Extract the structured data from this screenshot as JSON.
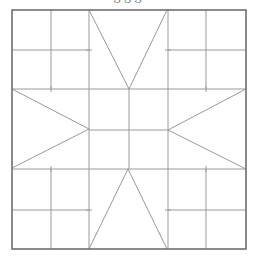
{
  "caption": "g                                              g         g",
  "diagram": {
    "type": "quilt-block-pattern",
    "stroke_colors": {
      "outer": "#6f6f6f",
      "grid": "#9a9a9a",
      "diagonal": "#8c8c8c"
    },
    "outer_square": {
      "x1": 12,
      "y1": 10,
      "x2": 246,
      "y2": 249
    },
    "columns_x": [
      12,
      51,
      89,
      129,
      168,
      206,
      246
    ],
    "rows_y": [
      10,
      50,
      89,
      130,
      169,
      210,
      249
    ],
    "corner_blocks": [
      {
        "name": "top-left",
        "cells": 4
      },
      {
        "name": "top-right",
        "cells": 4
      },
      {
        "name": "bottom-left",
        "cells": 4
      },
      {
        "name": "bottom-right",
        "cells": 4
      }
    ],
    "center_block": {
      "cells": 4
    },
    "star_points": [
      {
        "name": "top",
        "points": [
          [
            89,
            10
          ],
          [
            129,
            89
          ],
          [
            167,
            10
          ]
        ]
      },
      {
        "name": "bottom",
        "points": [
          [
            89,
            249
          ],
          [
            128,
            169
          ],
          [
            167,
            249
          ]
        ]
      },
      {
        "name": "left",
        "points": [
          [
            12,
            89
          ],
          [
            89,
            129
          ],
          [
            12,
            168
          ]
        ]
      },
      {
        "name": "right",
        "points": [
          [
            246,
            89
          ],
          [
            168,
            130
          ],
          [
            246,
            169
          ]
        ]
      }
    ]
  }
}
